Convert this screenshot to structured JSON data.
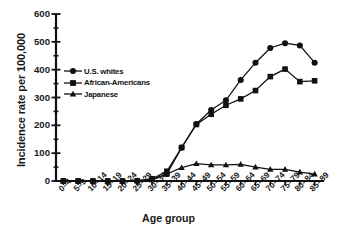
{
  "chart_data": {
    "type": "line",
    "title": "",
    "xlabel": "Age group",
    "ylabel": "Incidence rate per 100,000",
    "categories": [
      "0–4",
      "5–9",
      "10–14",
      "15–19",
      "20–24",
      "25–29",
      "30–34",
      "35–39",
      "40–44",
      "45–49",
      "50–54",
      "55–59",
      "60–64",
      "65–69",
      "70–74",
      "75–79",
      "80–84",
      "85–89"
    ],
    "ylim": [
      0,
      600
    ],
    "yticks": [
      0,
      100,
      200,
      300,
      400,
      500,
      600
    ],
    "ytick_labels": [
      "0",
      "100",
      "200",
      "300",
      "400",
      "500",
      "600"
    ],
    "yminor_step": 50,
    "grid": false,
    "legend_position": "upper-left-inside",
    "series": [
      {
        "name": "U.S. whites",
        "marker": "circle",
        "color": "#111111",
        "values": [
          0,
          0,
          0,
          0,
          0,
          0,
          5,
          25,
          120,
          205,
          255,
          290,
          363,
          425,
          478,
          495,
          487,
          425
        ]
      },
      {
        "name": "African-Americans",
        "marker": "square",
        "color": "#111111",
        "values": [
          0,
          0,
          0,
          0,
          0,
          1,
          8,
          35,
          120,
          203,
          240,
          272,
          295,
          325,
          375,
          402,
          357,
          360
        ]
      },
      {
        "name": "Japanese",
        "marker": "triangle",
        "color": "#111111",
        "values": [
          0,
          0,
          0,
          0,
          0,
          1,
          4,
          25,
          48,
          62,
          58,
          58,
          60,
          50,
          42,
          42,
          32,
          25
        ]
      }
    ]
  },
  "axis": {
    "y_title": "Incidence rate per 100,000",
    "x_title": "Age group"
  },
  "legend": {
    "items": [
      {
        "label": "U.S. whites",
        "marker": "circle"
      },
      {
        "label": "African-Americans",
        "marker": "square"
      },
      {
        "label": "Japanese",
        "marker": "triangle"
      }
    ]
  }
}
